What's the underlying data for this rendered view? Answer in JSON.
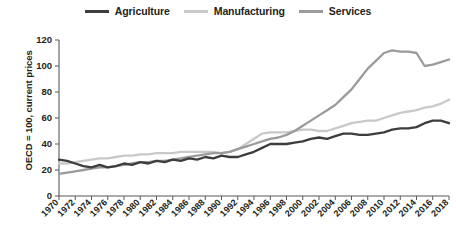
{
  "chart_data": {
    "type": "line",
    "title": "",
    "xlabel": "",
    "ylabel": "OECD = 100, current prices",
    "ylim": [
      0,
      120
    ],
    "yticks": [
      0,
      20,
      40,
      60,
      80,
      100,
      120
    ],
    "grid": false,
    "legend_position": "top-center",
    "x": [
      1970,
      1971,
      1972,
      1973,
      1974,
      1975,
      1976,
      1977,
      1978,
      1979,
      1980,
      1981,
      1982,
      1983,
      1984,
      1985,
      1986,
      1987,
      1988,
      1989,
      1990,
      1991,
      1992,
      1993,
      1994,
      1995,
      1996,
      1997,
      1998,
      1999,
      2000,
      2001,
      2002,
      2003,
      2004,
      2005,
      2006,
      2007,
      2008,
      2009,
      2010,
      2011,
      2012,
      2013,
      2014,
      2015,
      2016,
      2017,
      2018
    ],
    "xticks": [
      1970,
      1972,
      1974,
      1976,
      1978,
      1980,
      1982,
      1984,
      1986,
      1988,
      1990,
      1992,
      1994,
      1996,
      1998,
      2000,
      2002,
      2004,
      2006,
      2008,
      2010,
      2012,
      2014,
      2016,
      2018
    ],
    "series": [
      {
        "name": "Agriculture",
        "color": "#3d3d3d",
        "values": [
          28,
          27,
          25,
          23,
          22,
          24,
          22,
          23,
          25,
          24,
          26,
          25,
          27,
          26,
          28,
          27,
          29,
          28,
          30,
          29,
          31,
          30,
          30,
          32,
          34,
          37,
          40,
          40,
          40,
          41,
          42,
          44,
          45,
          44,
          46,
          48,
          48,
          47,
          47,
          48,
          49,
          51,
          52,
          52,
          53,
          56,
          58,
          58,
          56
        ]
      },
      {
        "name": "Manufacturing",
        "color": "#c9c9c9",
        "values": [
          25,
          25,
          26,
          27,
          28,
          29,
          29,
          30,
          31,
          31,
          32,
          32,
          33,
          33,
          33,
          34,
          34,
          34,
          34,
          34,
          33,
          34,
          36,
          40,
          44,
          48,
          49,
          49,
          49,
          50,
          51,
          51,
          50,
          50,
          52,
          54,
          56,
          57,
          58,
          58,
          60,
          62,
          64,
          65,
          66,
          68,
          69,
          71,
          74
        ]
      },
      {
        "name": "Services",
        "color": "#9b9b9b",
        "values": [
          17,
          18,
          19,
          20,
          21,
          22,
          22,
          23,
          24,
          25,
          26,
          26,
          27,
          27,
          28,
          29,
          30,
          31,
          32,
          33,
          33,
          34,
          36,
          38,
          40,
          42,
          44,
          45,
          47,
          50,
          54,
          58,
          62,
          66,
          70,
          76,
          82,
          90,
          98,
          104,
          110,
          112,
          111,
          111,
          110,
          100,
          101,
          103,
          105
        ]
      }
    ]
  }
}
